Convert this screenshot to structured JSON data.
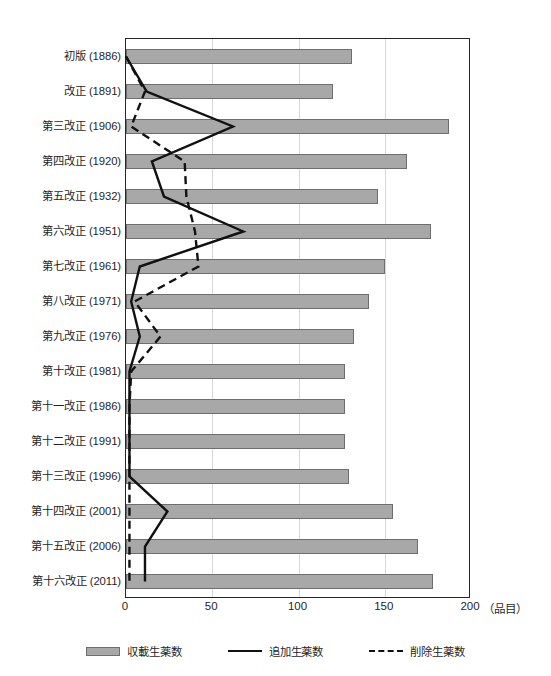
{
  "chart_data": {
    "type": "bar",
    "title": "",
    "subtitle": "",
    "xlabel": "（品目）",
    "ylabel": "",
    "xlim": [
      0,
      200
    ],
    "xticks": [
      0,
      50,
      100,
      150,
      200
    ],
    "xticklabels": [
      "0",
      "50",
      "100",
      "150",
      "200"
    ],
    "grid": "vertical",
    "legend_position": "bottom-center",
    "orientation": "horizontal",
    "categories": [
      "初版 (1886)",
      "改正 (1891)",
      "第三改正 (1906)",
      "第四改正 (1920)",
      "第五改正 (1932)",
      "第六改正 (1951)",
      "第七改正 (1961)",
      "第八改正 (1971)",
      "第九改正 (1976)",
      "第十改正 (1981)",
      "第十一改正 (1986)",
      "第十二改正 (1991)",
      "第十三改正 (1996)",
      "第十四改正 (2001)",
      "第十五改正 (2006)",
      "第十六改正 (2011)"
    ],
    "series": [
      {
        "name": "収載生薬数",
        "render": "bar",
        "color": "#a8a8a8",
        "edgecolor": "#6e6e6e",
        "values": [
          131,
          120,
          187,
          163,
          146,
          177,
          150,
          141,
          132,
          127,
          127,
          127,
          129,
          155,
          169,
          178
        ]
      },
      {
        "name": "追加生薬数",
        "render": "line-solid",
        "color": "#111111",
        "values": [
          0,
          12,
          62,
          15,
          22,
          68,
          8,
          3,
          8,
          2,
          2,
          2,
          2,
          24,
          11,
          11
        ]
      },
      {
        "name": "削除生薬数",
        "render": "line-dashed",
        "color": "#111111",
        "values": [
          0,
          11,
          3,
          34,
          35,
          40,
          42,
          5,
          20,
          3,
          2,
          2,
          2,
          2,
          2,
          2
        ]
      }
    ]
  },
  "legend": {
    "items": [
      {
        "label": "収載生薬数",
        "marker": "bar-swatch"
      },
      {
        "label": "追加生薬数",
        "marker": "solid-line"
      },
      {
        "label": "削除生薬数",
        "marker": "dashed-line"
      }
    ]
  },
  "axis": {
    "x_unit_label": "（品目）"
  }
}
